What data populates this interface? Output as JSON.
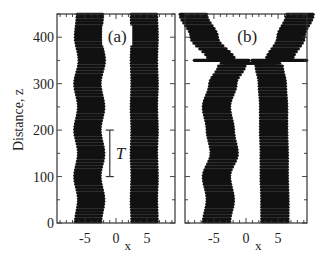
{
  "figure": {
    "ylabel": "Distance, z",
    "xlabel": "x",
    "colors": {
      "ink": "#111111",
      "frame": "#333333",
      "background": "#ffffff"
    }
  },
  "chart_data": [
    {
      "type": "line",
      "panel_label": "(a)",
      "title": "",
      "xlabel": "x",
      "ylabel": "Distance, z",
      "xlim": [
        -9.5,
        9.5
      ],
      "ylim": [
        0,
        450
      ],
      "x_ticks": [
        -5,
        0,
        5
      ],
      "y_ticks": [
        0,
        100,
        200,
        300,
        400
      ],
      "annotations": [
        {
          "text": "T",
          "type": "period-bar",
          "x": -1.0,
          "z_from": 100,
          "z_to": 200
        }
      ],
      "series": [
        {
          "name": "left beam",
          "style": "striped",
          "z": [
            0,
            50,
            100,
            150,
            200,
            250,
            300,
            350,
            400,
            450
          ],
          "x_center": [
            -4.5,
            -4.0,
            -4.6,
            -4.0,
            -4.6,
            -4.0,
            -4.6,
            -3.9,
            -4.5,
            -4.2
          ]
        },
        {
          "name": "right beam",
          "style": "striped",
          "z": [
            0,
            50,
            100,
            150,
            200,
            250,
            300,
            350,
            400,
            450
          ],
          "x_center": [
            4.6,
            4.5,
            4.6,
            4.5,
            4.6,
            4.5,
            4.6,
            4.5,
            4.6,
            4.5
          ]
        }
      ]
    },
    {
      "type": "line",
      "panel_label": "(b)",
      "title": "",
      "xlabel": "x",
      "ylabel": "",
      "xlim": [
        -9.5,
        9.5
      ],
      "ylim": [
        0,
        450
      ],
      "x_ticks": [
        -5,
        0,
        5
      ],
      "y_ticks": [
        0,
        100,
        200,
        300,
        400
      ],
      "series": [
        {
          "name": "left beam",
          "style": "striped",
          "z": [
            0,
            50,
            100,
            150,
            200,
            250,
            300,
            340,
            350,
            400,
            450
          ],
          "x_center": [
            -4.6,
            -4.0,
            -4.6,
            -3.4,
            -4.0,
            -4.6,
            -3.6,
            -2.2,
            5.2,
            7.0,
            8.4
          ]
        },
        {
          "name": "right beam",
          "style": "striped",
          "z": [
            0,
            50,
            100,
            150,
            200,
            250,
            300,
            340,
            350,
            400,
            450
          ],
          "x_center": [
            4.5,
            4.5,
            4.4,
            4.4,
            4.3,
            4.3,
            4.1,
            3.6,
            -3.8,
            -6.5,
            -8.2
          ]
        }
      ]
    }
  ]
}
